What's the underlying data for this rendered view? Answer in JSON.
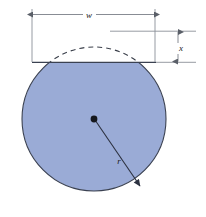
{
  "figure": {
    "labels": {
      "width": "w",
      "depth": "x",
      "radius": "r"
    },
    "colors": {
      "fill": "#9aabd6",
      "outline": "#3a4151",
      "dimension_line": "#7a7f88",
      "dash_arc": "#3a3f4a",
      "background": "#ffffff",
      "center_dot": "#16181d",
      "label_text": "#1a1a1a"
    },
    "geometry": {
      "circle_center_x": 94,
      "circle_center_y": 119,
      "circle_radius": 72,
      "chord_y": 62,
      "arc_top_y": 31,
      "width_dimension_y": 14,
      "depth_dimension_x": 178,
      "extension_left_x": 32,
      "extension_right_x": 155,
      "radius_end_x": 141,
      "radius_end_y": 187
    },
    "annotations": {
      "width_label_x": 89,
      "width_label_y": 17,
      "depth_label_x": 181,
      "depth_label_y": 50,
      "radius_label_x": 119,
      "radius_label_y": 163
    }
  }
}
